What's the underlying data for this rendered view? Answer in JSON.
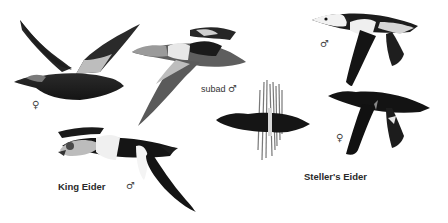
{
  "plate": {
    "title": "Eiders in flight",
    "colors": {
      "background": "#ffffff",
      "plumage_dark": "#1a1a1a",
      "plumage_mid": "#555555",
      "plumage_light": "#d8d8d8",
      "label": "#333333"
    }
  },
  "birds": [
    {
      "id": "king-eider-female",
      "species": "King Eider",
      "sex_symbol": "♀",
      "sex_label_pos": [
        34,
        103
      ]
    },
    {
      "id": "king-eider-subadult-male",
      "species": "King Eider",
      "age": "subad",
      "sex_symbol": "♂",
      "label_pos": [
        201,
        86
      ]
    },
    {
      "id": "king-eider-male",
      "species": "King Eider",
      "sex_symbol": "♂",
      "sex_label_pos": [
        127,
        184
      ]
    },
    {
      "id": "eider-from-below",
      "species": "Steller's Eider",
      "view": "underside"
    },
    {
      "id": "stellers-eider-male",
      "species": "Steller's Eider",
      "sex_symbol": "♂",
      "sex_label_pos": [
        320,
        40
      ]
    },
    {
      "id": "stellers-eider-female",
      "species": "Steller's Eider",
      "sex_symbol": "♀",
      "sex_label_pos": [
        336,
        134
      ]
    }
  ],
  "labels": {
    "king_eider": "King Eider",
    "stellers_eider": "Steller's Eider",
    "subad": "subad",
    "male": "♂",
    "female": "♀"
  }
}
